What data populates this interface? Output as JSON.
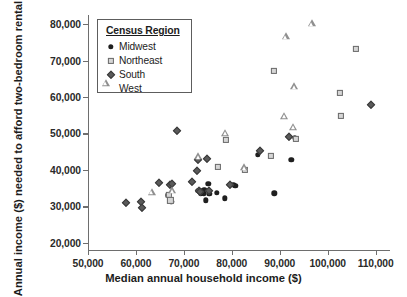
{
  "chart_data": {
    "type": "scatter",
    "title": "",
    "xlabel": "Median annual household income ($)",
    "ylabel": "Annual income ($) needed to afford two-bedroom rental",
    "xlim": [
      50000,
      113000
    ],
    "ylim": [
      18000,
      82500
    ],
    "xticks": [
      50000,
      60000,
      70000,
      80000,
      90000,
      100000,
      110000
    ],
    "yticks": [
      20000,
      30000,
      40000,
      50000,
      60000,
      70000,
      80000
    ],
    "xticklabels": [
      "50,000",
      "60,000",
      "70,000",
      "80,000",
      "90,000",
      "100,000",
      "110,000"
    ],
    "yticklabels": [
      "20,000",
      "30,000",
      "40,000",
      "50,000",
      "60,000",
      "70,000",
      "80,000"
    ],
    "grid": false,
    "legend_title": "Census Region",
    "legend_position": "upper-left-inside",
    "series": [
      {
        "name": "Midwest",
        "marker": "filled-circle",
        "color": "#1f1f1f",
        "points": [
          [
            66600,
            33000
          ],
          [
            67100,
            31500
          ],
          [
            67400,
            31300
          ],
          [
            72900,
            34300
          ],
          [
            73300,
            33900
          ],
          [
            73500,
            33500
          ],
          [
            73700,
            34100
          ],
          [
            74100,
            33600
          ],
          [
            74300,
            34600
          ],
          [
            74600,
            31600
          ],
          [
            75100,
            36100
          ],
          [
            75300,
            33400
          ],
          [
            76900,
            33700
          ],
          [
            78600,
            32200
          ],
          [
            80300,
            35900
          ],
          [
            80700,
            35700
          ],
          [
            85400,
            44200
          ],
          [
            88900,
            33600
          ],
          [
            92400,
            42700
          ],
          [
            93100,
            48800
          ]
        ]
      },
      {
        "name": "Northeast",
        "marker": "open-square",
        "color": "#d6d6d6",
        "points": [
          [
            66800,
            33200
          ],
          [
            67200,
            31600
          ],
          [
            77100,
            40900
          ],
          [
            78800,
            48300
          ],
          [
            82700,
            39900
          ],
          [
            88200,
            43800
          ],
          [
            88800,
            67200
          ],
          [
            93300,
            48400
          ],
          [
            102600,
            61100
          ],
          [
            102800,
            54700
          ],
          [
            105900,
            73300
          ]
        ]
      },
      {
        "name": "South",
        "marker": "filled-diamond",
        "color": "#5a5a5a",
        "points": [
          [
            57900,
            31000
          ],
          [
            61100,
            31200
          ],
          [
            61200,
            29600
          ],
          [
            64800,
            36300
          ],
          [
            67200,
            35800
          ],
          [
            67500,
            36100
          ],
          [
            68500,
            50700
          ],
          [
            71700,
            36600
          ],
          [
            72700,
            39600
          ],
          [
            72900,
            42800
          ],
          [
            73100,
            34200
          ],
          [
            73400,
            33800
          ],
          [
            74800,
            43100
          ],
          [
            75200,
            34200
          ],
          [
            79600,
            35800
          ],
          [
            85800,
            45200
          ],
          [
            91900,
            48900
          ],
          [
            109100,
            57900
          ]
        ]
      },
      {
        "name": "West",
        "marker": "open-triangle",
        "color": "#8f8f8f",
        "points": [
          [
            63300,
            34000
          ],
          [
            67600,
            34400
          ],
          [
            73000,
            43700
          ],
          [
            78700,
            50200
          ],
          [
            82600,
            40700
          ],
          [
            91000,
            54800
          ],
          [
            91300,
            76700
          ],
          [
            92800,
            51800
          ],
          [
            93000,
            63000
          ],
          [
            96700,
            80200
          ]
        ]
      }
    ]
  }
}
